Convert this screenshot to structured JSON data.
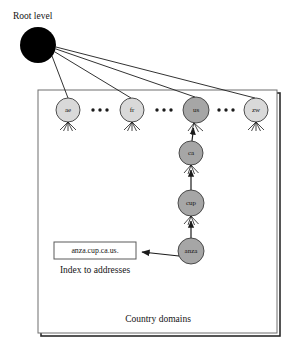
{
  "diagram": {
    "title_label": "Root level",
    "container_caption": "Country domains",
    "index_caption": "Index to addresses",
    "index_box_value": "anza.cup.ca.us.",
    "colors": {
      "root_node_fill": "#000000",
      "country_node_fill": "#d9d9d9",
      "highlight_node_fill": "#a6a6a6",
      "chain_node_fill": "#a6a6a6",
      "node_stroke": "#3c3c3c",
      "line_stroke": "#1b1b1b",
      "container_stroke": "#6e6e6e",
      "text_color": "#141414"
    },
    "root_node": {
      "name": "root-node",
      "cx": 38,
      "cy": 45,
      "r": 18
    },
    "country_nodes": [
      {
        "label": "ae",
        "cx": 68,
        "cy": 110,
        "r": 12,
        "highlighted": false
      },
      {
        "label": "fr",
        "cx": 132,
        "cy": 110,
        "r": 12,
        "highlighted": false
      },
      {
        "label": "us",
        "cx": 196,
        "cy": 110,
        "r": 13,
        "highlighted": true
      },
      {
        "label": "zw",
        "cx": 256,
        "cy": 110,
        "r": 12,
        "highlighted": false
      }
    ],
    "ellipsis_groups": [
      {
        "cx": 100,
        "cy": 110
      },
      {
        "cx": 164,
        "cy": 110
      },
      {
        "cx": 226,
        "cy": 110
      }
    ],
    "chain_nodes": [
      {
        "label": "ca",
        "cx": 191,
        "cy": 153,
        "r": 12
      },
      {
        "label": "cup",
        "cx": 191,
        "cy": 203,
        "r": 13
      },
      {
        "label": "anza",
        "cx": 191,
        "cy": 251,
        "r": 13
      }
    ],
    "container_box": {
      "x": 38,
      "y": 90,
      "w": 239,
      "h": 243
    },
    "index_box": {
      "x": 54,
      "y": 242,
      "w": 82,
      "h": 17
    }
  }
}
